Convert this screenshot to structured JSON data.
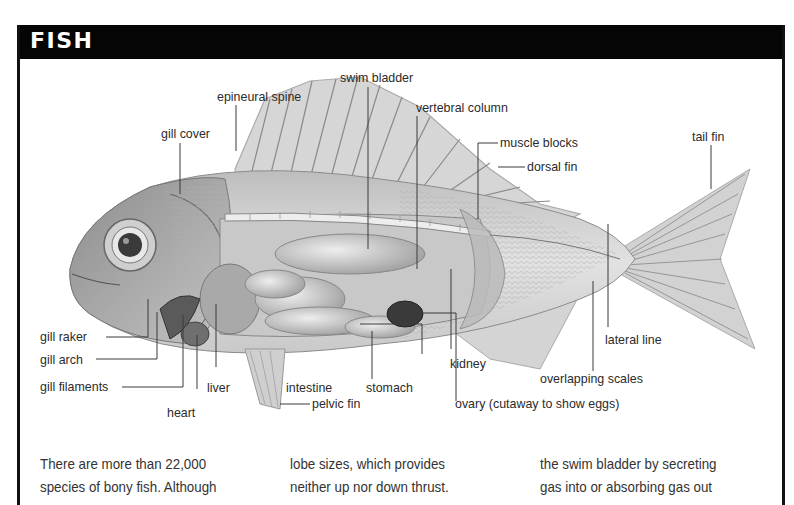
{
  "page": {
    "top_clipped_text": "as in lizards, adapt ... digested ... body ..."
  },
  "panel": {
    "title": "FISH"
  },
  "diagram": {
    "labels": {
      "epineural_spine": "epineural spine",
      "gill_cover": "gill cover",
      "swim_bladder": "swim bladder",
      "vertebral_column": "vertebral column",
      "muscle_blocks": "muscle blocks",
      "dorsal_fin": "dorsal fin",
      "tail_fin": "tail fin",
      "gill_raker": "gill raker",
      "gill_arch": "gill arch",
      "gill_filaments": "gill filaments",
      "liver": "liver",
      "heart": "heart",
      "intestine": "intestine",
      "stomach": "stomach",
      "kidney": "kidney",
      "pelvic_fin": "pelvic fin",
      "ovary": "ovary (cutaway to show eggs)",
      "lateral_line": "lateral line",
      "overlapping_scales": "overlapping scales"
    }
  },
  "body_text": {
    "col1": [
      "There are more than 22,000",
      "species of bony fish. Although"
    ],
    "col2": [
      "lobe sizes, which provides",
      "neither up nor down thrust."
    ],
    "col3": [
      "the swim bladder by secreting",
      "gas into or absorbing gas out"
    ]
  }
}
